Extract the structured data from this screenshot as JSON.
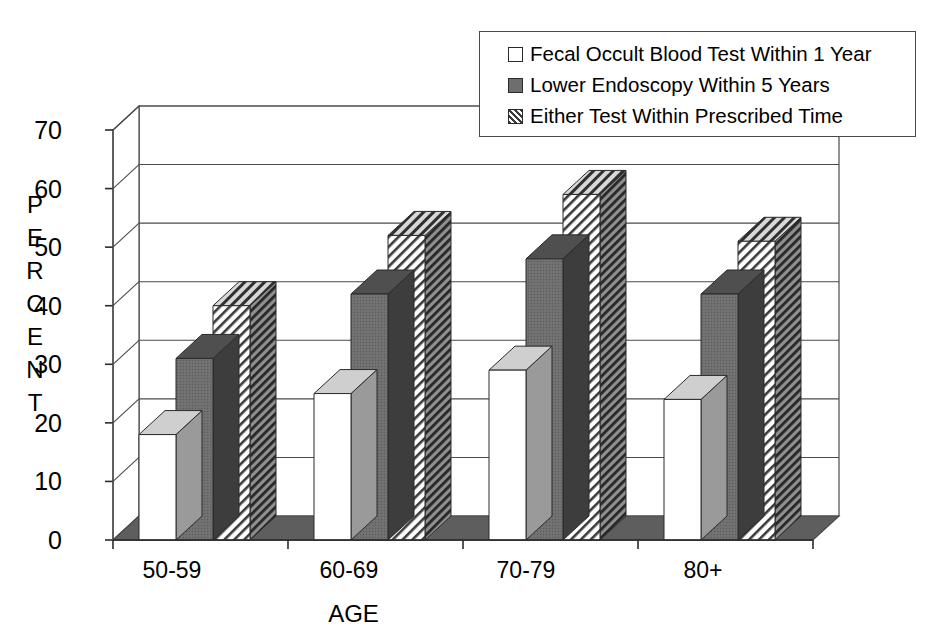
{
  "chart_data": {
    "type": "bar",
    "title": "",
    "xlabel": "AGE",
    "ylabel": "PERCENT",
    "ylim": [
      0,
      70
    ],
    "yticks": [
      0,
      10,
      20,
      30,
      40,
      50,
      60,
      70
    ],
    "categories": [
      "50-59",
      "60-69",
      "70-79",
      "80+"
    ],
    "grid": true,
    "legend_position": "top-right",
    "three_d": true,
    "series": [
      {
        "name": "Fecal Occult Blood Test Within 1 Year",
        "style": "white",
        "values": [
          18,
          25,
          29,
          24
        ]
      },
      {
        "name": "Lower Endoscopy Within 5 Years",
        "style": "solid-gray",
        "values": [
          31,
          42,
          48,
          42
        ]
      },
      {
        "name": "Either Test Within Prescribed Time",
        "style": "hatched",
        "values": [
          40,
          52,
          59,
          51
        ]
      }
    ]
  },
  "axis": {
    "ylabel_letters": [
      "P",
      "E",
      "R",
      "C",
      "E",
      "N",
      "T"
    ],
    "ytick_labels": [
      "70",
      "60",
      "50",
      "40",
      "30",
      "20",
      "10",
      "0"
    ],
    "xtick_labels": [
      "50-59",
      "60-69",
      "70-79",
      "80+"
    ],
    "xaxis_title": "AGE"
  },
  "legend": {
    "items": [
      {
        "label": "Fecal Occult Blood Test Within 1 Year",
        "swatch": "white-square-icon"
      },
      {
        "label": "Lower Endoscopy Within 5 Years",
        "swatch": "gray-square-icon"
      },
      {
        "label": "Either Test Within Prescribed Time",
        "swatch": "hatched-square-icon"
      }
    ]
  },
  "colors": {
    "bar_white_face": "#ffffff",
    "bar_gray_face": "#6b6b6b",
    "bar_gray_top": "#4f4f4f",
    "bar_gray_side": "#3f3f3f",
    "bar_hatch_line": "#3a3a3a",
    "floor": "#5e5e5e",
    "frame": "#4a4a4a",
    "text": "#000000"
  }
}
